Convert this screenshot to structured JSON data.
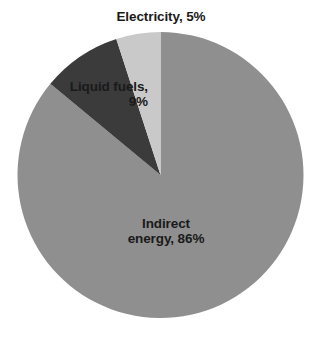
{
  "chart_data": {
    "type": "pie",
    "title": "",
    "categories": [
      "Electricity",
      "Liquid fuels",
      "Indirect energy"
    ],
    "values": [
      5,
      9,
      86
    ],
    "value_unit": "%",
    "labels": [
      "Electricity, 5%",
      "Liquid fuels,\n9%",
      "Indirect\nenergy, 86%"
    ],
    "colors": [
      "#c9c9c9",
      "#3b3b3b",
      "#8f8f8f"
    ],
    "legend": "none",
    "grid": false,
    "start_angle_deg": 0,
    "direction": "counterclockwise",
    "background": "#ffffff",
    "label_color": "#1a1a1a"
  },
  "slices": {
    "electricity": {
      "name": "Electricity",
      "value": 5,
      "label": "Electricity, 5%",
      "color": "#c9c9c9"
    },
    "liquid_fuels": {
      "name": "Liquid fuels",
      "value": 9,
      "label_line1": "Liquid fuels,",
      "label_line2": "9%",
      "color": "#3b3b3b"
    },
    "indirect_energy": {
      "name": "Indirect energy",
      "value": 86,
      "label_line1": "Indirect",
      "label_line2": "energy, 86%",
      "color": "#8f8f8f"
    }
  }
}
